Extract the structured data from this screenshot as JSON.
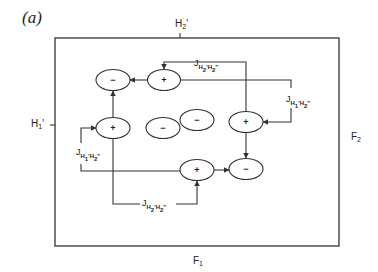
{
  "panel_label": "(a)",
  "axes": {
    "top": {
      "base": "H",
      "sub": "2",
      "prime": "'"
    },
    "left": {
      "base": "H",
      "sub": "1",
      "prime": "'"
    },
    "right": {
      "base": "F",
      "sub": "2"
    },
    "bottom": {
      "base": "F",
      "sub": "1"
    }
  },
  "nodes": [
    {
      "id": "n1",
      "sign": "-",
      "cx": 113,
      "cy": 80
    },
    {
      "id": "n2",
      "sign": "+",
      "cx": 164,
      "cy": 80
    },
    {
      "id": "n3",
      "sign": "+",
      "cx": 113,
      "cy": 128
    },
    {
      "id": "n4",
      "sign": "-",
      "cx": 163,
      "cy": 128
    },
    {
      "id": "n5",
      "sign": "-",
      "cx": 197,
      "cy": 120
    },
    {
      "id": "n6",
      "sign": "+",
      "cx": 246,
      "cy": 122
    },
    {
      "id": "n7",
      "sign": "+",
      "cx": 197,
      "cy": 170
    },
    {
      "id": "n8",
      "sign": "-",
      "cx": 246,
      "cy": 169
    }
  ],
  "couplings": {
    "top": {
      "j": "J",
      "a": "H",
      "as": "2",
      "ap": "'",
      "b": "H",
      "bs": "2",
      "bp": "\""
    },
    "right": {
      "j": "J",
      "a": "H",
      "as": "1",
      "ap": "'",
      "b": "H",
      "bs": "2",
      "bp": "\""
    },
    "left": {
      "j": "J",
      "a": "H",
      "as": "1",
      "ap": "'",
      "b": "H",
      "bs": "2",
      "bp": "\""
    },
    "bottom": {
      "j": "J",
      "a": "H",
      "as": "2",
      "ap": "'",
      "b": "H",
      "bs": "2",
      "bp": "\""
    }
  }
}
